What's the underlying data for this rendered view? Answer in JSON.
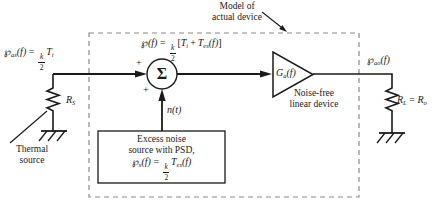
{
  "model_note": {
    "line1": "Model of",
    "line2": "actual device"
  },
  "labels": {
    "thermal_line1": "Thermal",
    "thermal_line2": "source",
    "noise_free_line1": "Noise-free",
    "noise_free_line2": "linear device",
    "excess_line1": "Excess noise",
    "excess_line2": "source with PSD,",
    "n_of_t": "n(t)",
    "sigma": "Σ",
    "plus_left": "+",
    "plus_bottom": "+"
  },
  "formulas": {
    "pas": {
      "p": "℘",
      "sub": "as",
      "arg": "(f)",
      "eq": "=",
      "num": "k",
      "den": "2",
      "t": "T",
      "tsub": "i"
    },
    "psum": {
      "p": "℘",
      "arg": "(f)",
      "eq": "=",
      "num": "k",
      "den": "2",
      "lb": "[",
      "t1": "T",
      "t1sub": "i",
      "plus": "+",
      "t2": "T",
      "t2sub": "es",
      "t2arg": "(f)",
      "rb": "]"
    },
    "px": {
      "p": "℘",
      "sub": "x",
      "arg": "(f)",
      "eq": "=",
      "num": "k",
      "den": "2",
      "t": "T",
      "tsub": "es",
      "targ": "(f)"
    },
    "pao": {
      "p": "℘",
      "sub": "ao",
      "arg": "(f)"
    },
    "ga": {
      "g": "G",
      "sub": "a",
      "arg": "(f)"
    },
    "rs": {
      "r": "R",
      "sub": "S"
    },
    "rl": {
      "r": "R",
      "sub": "L",
      "eq": "=",
      "r2": "R",
      "sub2": "o"
    }
  },
  "colors": {
    "line": "#1a1a1a",
    "dash": "#8a8a8a",
    "background": "#ffffff"
  }
}
